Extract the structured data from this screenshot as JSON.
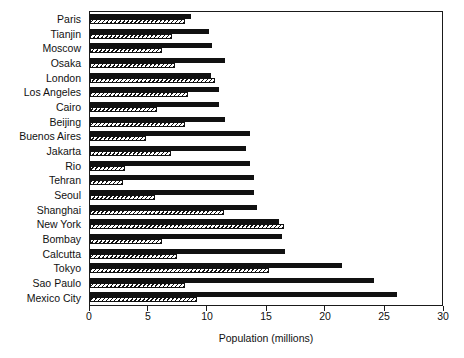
{
  "chart_data": {
    "type": "bar",
    "title": "",
    "subtitle": "",
    "orientation": "horizontal",
    "xlabel": "Population (millions)",
    "ylabel": "",
    "xlim": [
      0,
      30
    ],
    "xticks": [
      0,
      5,
      10,
      15,
      20,
      25,
      30
    ],
    "xticklabels": [
      "0",
      "5",
      "10",
      "15",
      "20",
      "25",
      "30"
    ],
    "grid": false,
    "legend": null,
    "annotations": [],
    "colors": {
      "series_1": "#111111",
      "series_2_fill": "#ffffff",
      "series_2_hatch": "#111111",
      "axis": "#1a1a1a",
      "text": "#111111",
      "background": "#ffffff"
    },
    "categories": [
      "Paris",
      "Tianjin",
      "Moscow",
      "Osaka",
      "London",
      "Los Angeles",
      "Cairo",
      "Beijing",
      "Buenos Aires",
      "Jakarta",
      "Rio",
      "Tehran",
      "Seoul",
      "Shanghai",
      "New York",
      "Bombay",
      "Calcutta",
      "Tokyo",
      "Sao Paulo",
      "Mexico City"
    ],
    "series": [
      {
        "name": "series-solid",
        "style": "solid-black",
        "values": [
          8.6,
          10.1,
          10.4,
          11.5,
          10.3,
          11.0,
          11.0,
          11.5,
          13.6,
          13.3,
          13.6,
          13.9,
          13.9,
          14.2,
          16.1,
          16.3,
          16.6,
          21.4,
          24.1,
          26.1
        ]
      },
      {
        "name": "series-hatched",
        "style": "hatched",
        "values": [
          8.1,
          7.0,
          6.1,
          7.2,
          10.6,
          8.3,
          5.7,
          8.1,
          4.8,
          6.9,
          3.0,
          2.8,
          5.5,
          11.4,
          16.5,
          6.1,
          7.4,
          15.2,
          8.1,
          9.1
        ]
      }
    ]
  }
}
